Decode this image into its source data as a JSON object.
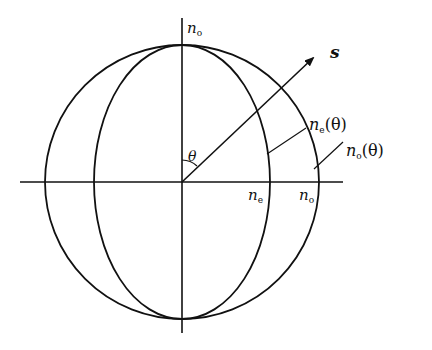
{
  "diagram": {
    "type": "index-ellipsoid-cross-section",
    "labels": {
      "axis_top": {
        "base": "n",
        "sub": "o"
      },
      "ne_axis": {
        "base": "n",
        "sub": "e"
      },
      "no_axis": {
        "base": "n",
        "sub": "o"
      },
      "ne_theta": {
        "base": "n",
        "sub": "e",
        "arg": "(θ)"
      },
      "no_theta": {
        "base": "n",
        "sub": "o",
        "arg": "(θ)"
      },
      "wave_vector": "s",
      "angle": "θ"
    },
    "colors": {
      "stroke": "#111111",
      "background": "#ffffff"
    }
  }
}
